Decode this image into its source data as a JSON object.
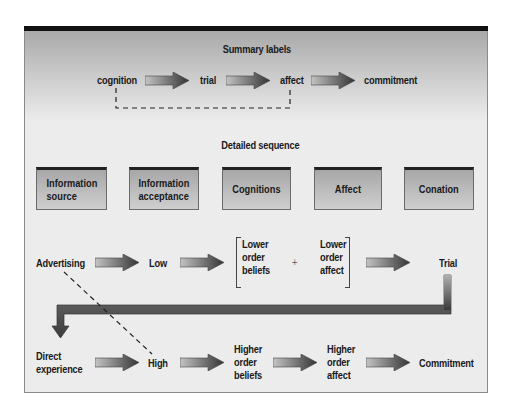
{
  "summary": {
    "title": "Summary labels",
    "steps": [
      "cognition",
      "trial",
      "affect",
      "commitment"
    ]
  },
  "detailed": {
    "title": "Detailed sequence",
    "boxes": [
      "Information\nsource",
      "Information\nacceptance",
      "Cognitions",
      "Affect",
      "Conation"
    ]
  },
  "low_path": {
    "source": "Advertising",
    "involvement": "Low",
    "beliefs": "Lower\norder\nbeliefs",
    "plus": "+",
    "affect": "Lower\norder\naffect",
    "outcome": "Trial"
  },
  "high_path": {
    "source": "Direct\nexperience",
    "involvement": "High",
    "beliefs": "Higher\norder\nbeliefs",
    "affect": "Higher\norder\naffect",
    "outcome": "Commitment"
  },
  "colors": {
    "arrow_dark": "#3a3a3a",
    "arrow_light": "#b8b8b8",
    "frame_bg": "#ececec",
    "top_bar": "#111111"
  }
}
